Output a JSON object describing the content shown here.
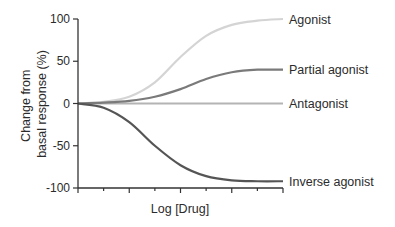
{
  "chart_data": {
    "type": "line",
    "title": "",
    "xlabel": "Log [Drug]",
    "ylabel_lines": [
      "Change from",
      "basal response (%)"
    ],
    "ylabel": "Change from basal response (%)",
    "ylim": [
      -100,
      100
    ],
    "yticks": [
      100,
      50,
      0,
      -50,
      -100
    ],
    "ytick_labels": [
      "100",
      "50",
      "0",
      "-50",
      "-100"
    ],
    "x_ticks_major": 5,
    "x_ticks_minor": 4,
    "grid": false,
    "legend_position": "inline-right",
    "x": [
      0,
      0.125,
      0.25,
      0.375,
      0.5,
      0.625,
      0.75,
      0.875,
      1.0
    ],
    "series": [
      {
        "name": "Agonist",
        "color": "#d4d4d4",
        "values": [
          0,
          2,
          8,
          25,
          55,
          80,
          93,
          98,
          100
        ]
      },
      {
        "name": "Partial agonist",
        "color": "#7a7a7a",
        "values": [
          0,
          1,
          3,
          8,
          17,
          29,
          37,
          40,
          40
        ]
      },
      {
        "name": "Antagonist",
        "color": "#b4b4b4",
        "values": [
          0,
          0,
          0,
          0,
          0,
          0,
          0,
          0,
          0
        ]
      },
      {
        "name": "Inverse agonist",
        "color": "#555555",
        "values": [
          0,
          -5,
          -22,
          -50,
          -73,
          -86,
          -91,
          -92,
          -92
        ]
      }
    ]
  }
}
